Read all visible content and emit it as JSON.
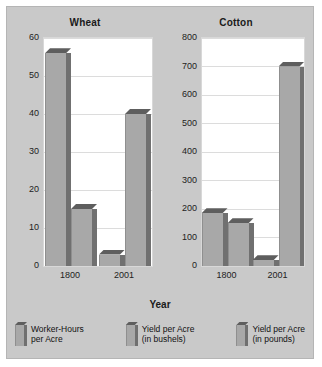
{
  "chart_data": {
    "type": "bar",
    "title": "",
    "xlabel": "Year",
    "ylabel": "",
    "grid": true,
    "legend_position": "bottom",
    "categories": [
      "1800",
      "2001"
    ],
    "panels": [
      {
        "title": "Wheat",
        "ylim": [
          0,
          60
        ],
        "yticks": [
          0,
          10,
          20,
          30,
          40,
          50,
          60
        ],
        "ytick_labels": [
          "0",
          "10",
          "20",
          "30",
          "40",
          "50",
          "60"
        ],
        "categories": [
          "1800",
          "2001"
        ],
        "series": [
          {
            "name": "Worker-Hours per Acre",
            "values": [
              56,
              3
            ]
          },
          {
            "name": "Yield per Acre (in bushels)",
            "values": [
              15,
              40
            ]
          }
        ]
      },
      {
        "title": "Cotton",
        "ylim": [
          0,
          800
        ],
        "yticks": [
          0,
          100,
          200,
          300,
          400,
          500,
          600,
          700,
          800
        ],
        "ytick_labels": [
          "0",
          "100",
          "200",
          "300",
          "400",
          "500",
          "600",
          "700",
          "800"
        ],
        "categories": [
          "1800",
          "2001"
        ],
        "series": [
          {
            "name": "Worker-Hours per Acre",
            "values": [
              185,
              20
            ]
          },
          {
            "name": "Yield per Acre (in pounds)",
            "values": [
              150,
              700
            ]
          }
        ]
      }
    ],
    "legend": [
      "Worker-Hours\nper Acre",
      "Yield per Acre\n(in bushels)",
      "Yield per Acre\n(in pounds)"
    ],
    "colors": {
      "bar_face": "#a8a8a8",
      "bar_side": "#707070",
      "bar_top": "#5e5e5e",
      "background": "#c9c9c9",
      "plot_background": "#ffffff",
      "gridline": "#dcdcdc"
    }
  }
}
